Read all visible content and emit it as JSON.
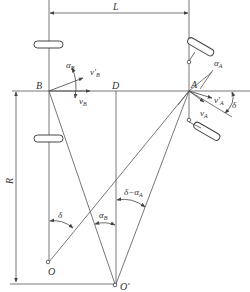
{
  "diagram": {
    "labels": {
      "L": "L",
      "R": "R",
      "A": "A",
      "B": "B",
      "D": "D",
      "O": "O",
      "O_prime": "O'",
      "alpha_A": "α",
      "alpha_A_sub": "A",
      "alpha_B": "α",
      "alpha_B_sub": "B",
      "v_prime_A": "v'",
      "v_prime_A_sub": "A",
      "v_A": "v",
      "v_A_sub": "A",
      "v_prime_B": "v'",
      "v_prime_B_sub": "B",
      "v_B": "v",
      "v_B_sub": "B",
      "delta_right": "δ",
      "delta_lower": "δ",
      "alpha_B_lower": "α",
      "alpha_B_lower_sub": "B",
      "delta_minus_alpha_A": "δ−α",
      "delta_minus_alpha_A_sub": "A"
    },
    "colors": {
      "line": "#555555",
      "text": "#333333",
      "background": "#ffffff"
    }
  }
}
